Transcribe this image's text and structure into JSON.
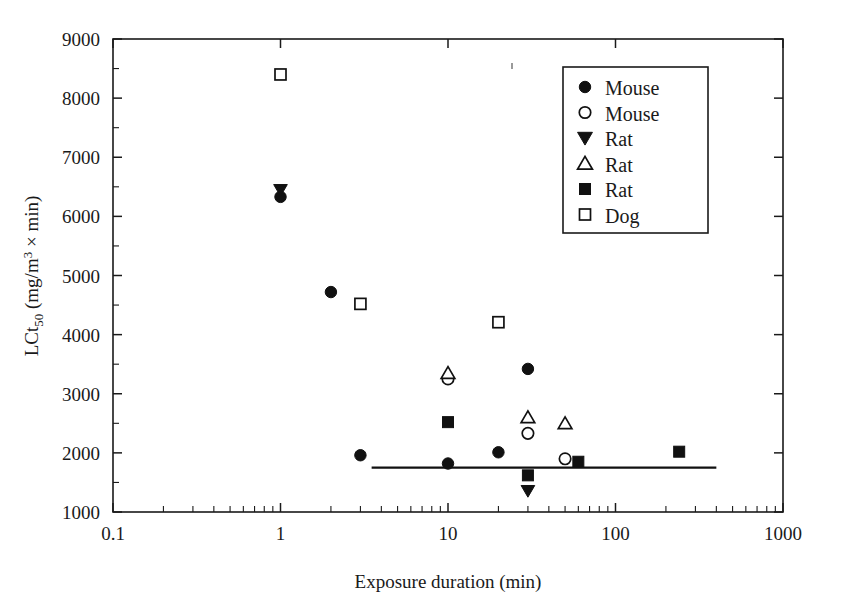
{
  "chart_data": {
    "type": "scatter",
    "title": "",
    "xlabel": "Exposure duration (min)",
    "ylabel": "LCt50 (mg/m3 x min)",
    "ylabel_parts": {
      "lead": "LCt",
      "sub": "50",
      "mid": " (mg/m",
      "sup": "3",
      "tail": " × min)"
    },
    "xscale": "log",
    "yscale": "linear",
    "xlim": [
      0.1,
      1000
    ],
    "ylim": [
      1000,
      9000
    ],
    "xticks": [
      "0.1",
      "1",
      "10",
      "100",
      "1000"
    ],
    "xtick_values": [
      0.1,
      1,
      10,
      100,
      1000
    ],
    "yticks": [
      "1000",
      "2000",
      "3000",
      "4000",
      "5000",
      "6000",
      "7000",
      "8000",
      "9000"
    ],
    "ytick_values": [
      1000,
      2000,
      3000,
      4000,
      5000,
      6000,
      7000,
      8000,
      9000
    ],
    "y_minor_step": 500,
    "grid": false,
    "legend_position": "top-right",
    "legend_entries": [
      {
        "label": "Mouse",
        "marker": "filled-circle"
      },
      {
        "label": "Mouse",
        "marker": "open-circle"
      },
      {
        "label": "Rat",
        "marker": "filled-down-triangle"
      },
      {
        "label": "Rat",
        "marker": "open-up-triangle"
      },
      {
        "label": "Rat",
        "marker": "filled-square"
      },
      {
        "label": "Dog",
        "marker": "open-square"
      }
    ],
    "series": [
      {
        "name": "Mouse",
        "marker": "filled-circle",
        "points": [
          {
            "x": 1,
            "y": 6330
          },
          {
            "x": 2,
            "y": 4720
          },
          {
            "x": 3,
            "y": 1960
          },
          {
            "x": 10,
            "y": 1820
          },
          {
            "x": 20,
            "y": 2010
          },
          {
            "x": 30,
            "y": 3420
          }
        ]
      },
      {
        "name": "Mouse",
        "marker": "open-circle",
        "points": [
          {
            "x": 10,
            "y": 3250
          },
          {
            "x": 30,
            "y": 2330
          },
          {
            "x": 50,
            "y": 1900
          }
        ]
      },
      {
        "name": "Rat",
        "marker": "filled-down-triangle",
        "points": [
          {
            "x": 1,
            "y": 6450
          },
          {
            "x": 30,
            "y": 1360
          }
        ]
      },
      {
        "name": "Rat",
        "marker": "open-up-triangle",
        "points": [
          {
            "x": 10,
            "y": 3350
          },
          {
            "x": 30,
            "y": 2600
          },
          {
            "x": 50,
            "y": 2500
          }
        ]
      },
      {
        "name": "Rat",
        "marker": "filled-square",
        "points": [
          {
            "x": 10,
            "y": 2520
          },
          {
            "x": 30,
            "y": 1620
          },
          {
            "x": 60,
            "y": 1850
          },
          {
            "x": 240,
            "y": 2020
          }
        ]
      },
      {
        "name": "Dog",
        "marker": "open-square",
        "points": [
          {
            "x": 1,
            "y": 8400
          },
          {
            "x": 3,
            "y": 4520
          },
          {
            "x": 20,
            "y": 4210
          }
        ]
      }
    ],
    "annotations": [
      {
        "type": "horizontal-line",
        "name": "reference-line",
        "y": 1750,
        "x_start": 3.5,
        "x_end": 400
      }
    ]
  }
}
